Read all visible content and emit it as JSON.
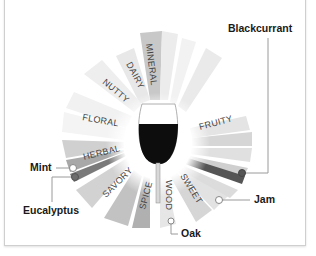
{
  "diagram": {
    "center": {
      "x": 158,
      "y": 145
    },
    "categories": [
      {
        "label": "MINERAL",
        "angle": -95,
        "color": "#c9c9c9"
      },
      {
        "label": "DAIRY",
        "angle": -112,
        "color": "#e6e6e6"
      },
      {
        "label": "NUTTY",
        "angle": -135,
        "color": "#ececec"
      },
      {
        "label": "FLORAL",
        "angle": -165,
        "color": "#f0f0f0"
      },
      {
        "label": "HERBAL",
        "angle": 166,
        "color": "#b8b8b8"
      },
      {
        "label": "SAVORY",
        "angle": 135,
        "color": "#cfcfcf"
      },
      {
        "label": "SPICE",
        "angle": 108,
        "color": "#bdbdbd"
      },
      {
        "label": "WOOD",
        "angle": 82,
        "color": "#e2e2e2"
      },
      {
        "label": "SWEET",
        "angle": 58,
        "color": "#d4d4d4"
      },
      {
        "label": "FRUITY",
        "angle": -15,
        "color": "#dcdcdc"
      }
    ],
    "callouts": {
      "blackcurrant": "Blackcurrant",
      "jam": "Jam",
      "oak": "Oak",
      "mint": "Mint",
      "eucalyptus": "Eucalyptus"
    },
    "colors": {
      "wine": "#0d0d0d",
      "highlight_dark": "#555555",
      "leader_line": "#9a9a9a"
    }
  }
}
